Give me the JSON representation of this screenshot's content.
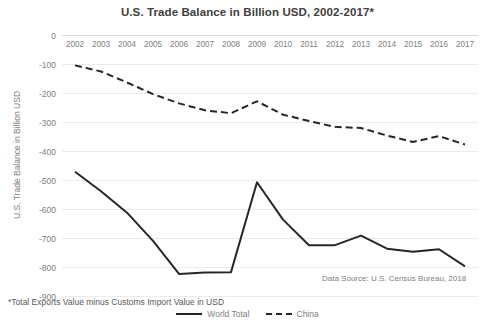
{
  "chart_data": {
    "type": "line",
    "title": "U.S. Trade Balance in Billion USD, 2002-2017*",
    "xlabel": "",
    "ylabel": "U.S. Trade Balance in Billion USD",
    "categories": [
      "2002",
      "2003",
      "2004",
      "2005",
      "2006",
      "2007",
      "2008",
      "2009",
      "2010",
      "2011",
      "2012",
      "2013",
      "2014",
      "2015",
      "2016",
      "2017"
    ],
    "ylim": [
      -900,
      0
    ],
    "ytick_labels": [
      "0",
      "-100",
      "-200",
      "-300",
      "-400",
      "-500",
      "-600",
      "-700",
      "-800",
      "-900"
    ],
    "ytick_values": [
      0,
      -100,
      -200,
      -300,
      -400,
      -500,
      -600,
      -700,
      -800,
      -900
    ],
    "grid": true,
    "legend_position": "bottom",
    "series": [
      {
        "name": "World Total",
        "style": "solid",
        "color": "#262626",
        "values": [
          -470,
          -537,
          -611,
          -708,
          -822,
          -817,
          -816,
          -506,
          -635,
          -723,
          -723,
          -690,
          -735,
          -746,
          -737,
          -796
        ]
      },
      {
        "name": "China",
        "style": "dashed",
        "color": "#262626",
        "values": [
          -103,
          -124,
          -162,
          -202,
          -234,
          -258,
          -268,
          -227,
          -273,
          -295,
          -315,
          -319,
          -345,
          -367,
          -347,
          -376
        ]
      }
    ],
    "annotations": {
      "data_source": "Data Source: U.S. Census Bureau, 2018",
      "footnote": "*Total Exports Value minus Customs Import Value in USD"
    }
  }
}
